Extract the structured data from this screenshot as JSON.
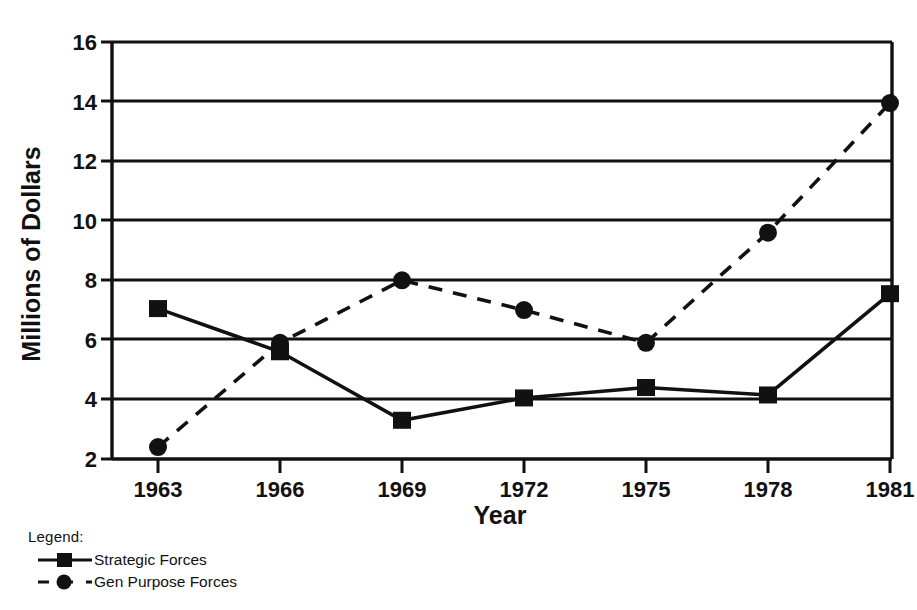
{
  "chart_data": {
    "type": "line",
    "title": "",
    "xlabel": "Year",
    "ylabel": "Millions of Dollars",
    "categories": [
      "1963",
      "1966",
      "1969",
      "1972",
      "1975",
      "1978",
      "1981"
    ],
    "x": [
      1963,
      1966,
      1969,
      1972,
      1975,
      1978,
      1981
    ],
    "series": [
      {
        "name": "Strategic Forces",
        "marker": "square",
        "line_style": "solid",
        "color": "#111111",
        "values": [
          7.05,
          5.6,
          3.3,
          4.05,
          4.4,
          4.15,
          7.55
        ]
      },
      {
        "name": "Gen Purpose Forces",
        "marker": "circle",
        "line_style": "dashed",
        "color": "#111111",
        "values": [
          2.4,
          5.9,
          8.0,
          7.0,
          5.9,
          9.6,
          13.95
        ]
      }
    ],
    "ylim": [
      2,
      16
    ],
    "yticks": [
      2,
      4,
      6,
      8,
      10,
      12,
      14,
      16
    ],
    "ytick_labels": [
      "2",
      "4",
      "6",
      "8",
      "10",
      "12",
      "14",
      "16"
    ],
    "grid": true,
    "grid_axis": "y",
    "legend_position": "below-left"
  },
  "legend": {
    "title": "Legend:",
    "entries": [
      {
        "label": "Strategic Forces",
        "marker": "square",
        "line_style": "solid"
      },
      {
        "label": "Gen Purpose Forces",
        "marker": "circle",
        "line_style": "dashed"
      }
    ]
  },
  "axes": {
    "y_title": "Millions of Dollars",
    "x_title": "Year",
    "y_ticks": [
      "2",
      "4",
      "6",
      "8",
      "10",
      "12",
      "14",
      "16"
    ],
    "x_ticks": [
      "1963",
      "1966",
      "1969",
      "1972",
      "1975",
      "1978",
      "1981"
    ]
  },
  "colors": {
    "ink": "#111111",
    "background": "#ffffff"
  }
}
